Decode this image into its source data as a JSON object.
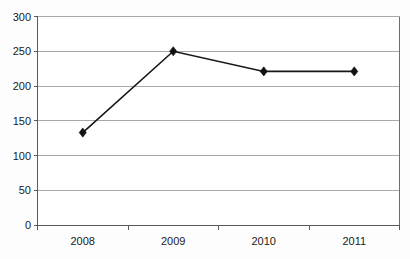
{
  "chart_data": {
    "type": "line",
    "title": "",
    "subtitle": "",
    "xlabel": "",
    "ylabel": "",
    "categories": [
      "2008",
      "2009",
      "2010",
      "2011"
    ],
    "values": [
      133,
      250,
      221,
      221
    ],
    "series": [
      {
        "name": "Series 1",
        "values": [
          133,
          250,
          221,
          221
        ]
      }
    ],
    "ylim": [
      0,
      300
    ],
    "ytick_labels": [
      "0",
      "50",
      "100",
      "150",
      "200",
      "250",
      "300"
    ],
    "ytick_values": [
      0,
      50,
      100,
      150,
      200,
      250,
      300
    ],
    "xtick_labels": [
      "2008",
      "2009",
      "2010",
      "2011"
    ],
    "grid": true,
    "grid_axis": "y",
    "legend": false,
    "legend_position": "none",
    "marker": "diamond",
    "colors": {
      "line": "#161616",
      "marker": "#111111",
      "gridline": "#a8a8a8",
      "frame": "#6e6e6e",
      "background": "#ffffff",
      "text": "#1a1a1a"
    }
  }
}
